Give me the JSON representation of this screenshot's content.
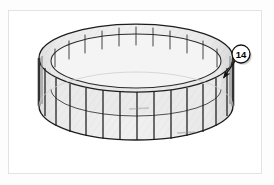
{
  "page": {
    "background_color": "#fdfdfd",
    "width": 274,
    "height": 185
  },
  "figure": {
    "frame": {
      "border_color": "#e3e3e3",
      "fill_color": "#ffffff",
      "x": 8,
      "y": 10,
      "width": 254,
      "height": 164
    },
    "title": "",
    "description": "Isometric technical illustration of a cylindrical ribbed ring (drum band) viewed from above, with a numbered callout balloon."
  },
  "part": {
    "name": "ribbed-cylindrical-ring",
    "shape": "open cylinder / ring band",
    "rib_count_total": 24,
    "rib_count_front_visible": 13,
    "rib_count_back_visible": 11,
    "line_color": "#1a1a1a",
    "surface_fill": "#ececec",
    "surface_fill_shadow": "#d6d6d6",
    "hatch_color": "#dcdcdc",
    "top_rim_color": "#202020",
    "inner_rim_color": "#2a2a2a"
  },
  "callout": {
    "label": "14",
    "balloon": {
      "shape": "circle",
      "cx": 232,
      "cy": 43,
      "r": 9,
      "fill": "#ffffff",
      "stroke": "#111111",
      "shadow": "#9a9a9a",
      "text_color": "#000000"
    },
    "leader": {
      "from_x": 226,
      "from_y": 50,
      "to_x": 213,
      "to_y": 69,
      "color": "#111111",
      "arrowhead": "solid-filled"
    },
    "points_to": "outer wall rib segment"
  },
  "annotations": [
    {
      "name": "inner-surface-marking",
      "text": "",
      "x": 178,
      "y": 122,
      "legible": false
    },
    {
      "name": "inner-rim-marking",
      "text": "",
      "x": 130,
      "y": 98,
      "legible": false
    }
  ],
  "colors": {
    "frame_border": "#e3e3e3",
    "page_background": "#fdfdfd",
    "ink": "#1a1a1a",
    "light_fill": "#ececec",
    "mid_fill": "#d9d9d9",
    "dark_edge": "#555555"
  }
}
